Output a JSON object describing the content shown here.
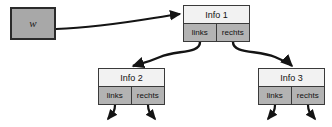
{
  "diagram": {
    "colors": {
      "node_header_bg": "#f2f2f2",
      "pointer_cell_bg": "#b3b3b3",
      "source_box_bg": "#a8a8a8",
      "stroke": "#3a3a3a",
      "background": "#ffffff"
    },
    "source": {
      "label": "w",
      "shape": "rectangle"
    },
    "nodes": [
      {
        "id": "info1",
        "title": "Info 1",
        "left_pointer_label": "links",
        "right_pointer_label": "rechts"
      },
      {
        "id": "info2",
        "title": "Info 2",
        "left_pointer_label": "links",
        "right_pointer_label": "rechts"
      },
      {
        "id": "info3",
        "title": "Info 3",
        "left_pointer_label": "links",
        "right_pointer_label": "rechts"
      }
    ],
    "edges": [
      {
        "from": "w",
        "to": "info1",
        "style": "straight-arrow"
      },
      {
        "from": "info1.links",
        "to": "info2",
        "style": "curved-arrow"
      },
      {
        "from": "info1.rechts",
        "to": "info3",
        "style": "curved-arrow"
      },
      {
        "from": "info2.links",
        "to": "dangling",
        "style": "short-curved-arrow"
      },
      {
        "from": "info2.rechts",
        "to": "dangling",
        "style": "short-curved-arrow"
      },
      {
        "from": "info3.links",
        "to": "dangling",
        "style": "short-curved-arrow"
      },
      {
        "from": "info3.rechts",
        "to": "dangling",
        "style": "short-curved-arrow"
      }
    ]
  }
}
